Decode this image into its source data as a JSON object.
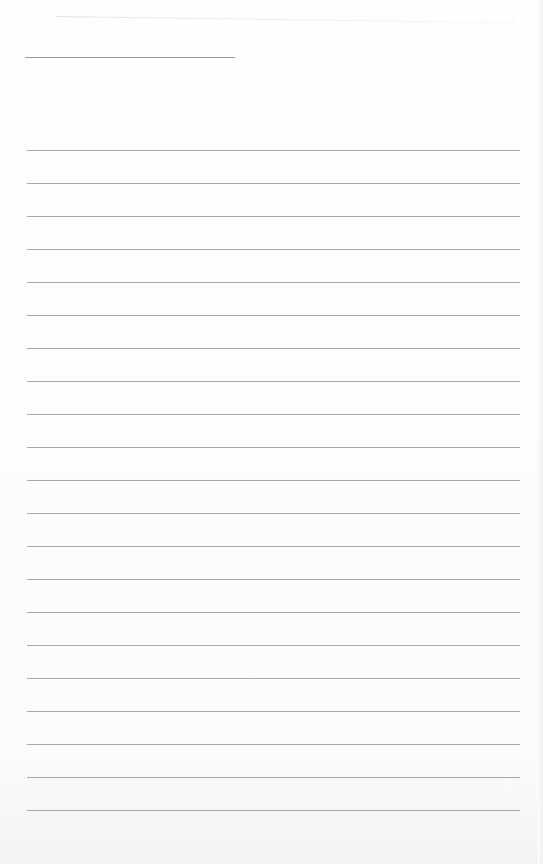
{
  "document": {
    "type": "lined-paper",
    "title_line": {
      "x": 25,
      "y": 57,
      "width": 210
    },
    "rules": {
      "count": 21,
      "start_y": 150,
      "spacing": 33,
      "left": 27,
      "width": 493
    },
    "colors": {
      "paper": "#fdfdfd",
      "rule": "#a8a8a8",
      "title_line": "#9a9a9a"
    }
  }
}
